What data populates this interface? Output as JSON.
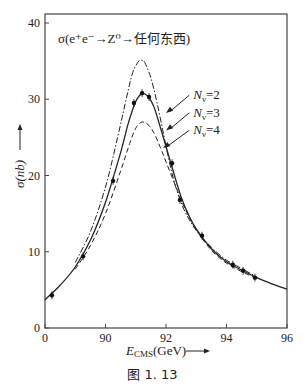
{
  "chart_data": {
    "type": "line",
    "title": "σ(e⁺e⁻→Z⁰→任何东西)",
    "xlabel": "E_CMS(GeV)",
    "ylabel": "σ(nb)",
    "xlim": [
      88,
      96
    ],
    "ylim": [
      0,
      40
    ],
    "x_ticks": [
      88,
      90,
      92,
      94,
      96
    ],
    "x_tick_labels": [
      "0",
      "90",
      "92",
      "94",
      "96"
    ],
    "y_ticks": [
      0,
      10,
      20,
      30,
      40
    ],
    "y_tick_labels": [
      "0",
      "10",
      "20",
      "30",
      "40"
    ],
    "grid": false,
    "caption": "图 1. 13",
    "series": [
      {
        "name": "Nν=2",
        "style": "dashdot",
        "x": [
          89.0,
          89.5,
          90.0,
          90.4,
          90.7,
          90.9,
          91.1,
          91.2,
          91.3,
          91.5,
          91.7,
          91.9,
          92.1,
          92.3,
          92.6,
          93.0,
          93.5,
          94.0,
          94.5,
          95.0
        ],
        "values": [
          8.6,
          12.6,
          18.5,
          25.0,
          30.3,
          33.5,
          35.0,
          35.1,
          34.8,
          32.8,
          29.6,
          25.8,
          22.0,
          18.8,
          15.5,
          12.8,
          10.6,
          8.9,
          7.8,
          6.7
        ]
      },
      {
        "name": "Nν=3",
        "style": "solid",
        "x": [
          88.0,
          88.5,
          89.0,
          89.5,
          90.0,
          90.5,
          90.75,
          91.0,
          91.2,
          91.4,
          91.6,
          91.8,
          92.0,
          92.25,
          92.5,
          92.75,
          93.0,
          93.5,
          94.0,
          94.5,
          95.0,
          95.5,
          96.0
        ],
        "values": [
          3.7,
          5.6,
          8.0,
          11.5,
          16.5,
          23.0,
          26.8,
          29.7,
          30.7,
          30.4,
          29.0,
          26.5,
          23.8,
          20.4,
          17.2,
          14.8,
          13.0,
          10.4,
          8.7,
          7.6,
          6.6,
          5.8,
          5.1
        ]
      },
      {
        "name": "Nν=4",
        "style": "dashed",
        "x": [
          89.0,
          89.5,
          90.0,
          90.5,
          90.8,
          91.0,
          91.2,
          91.4,
          91.6,
          91.8,
          92.0,
          92.3,
          92.6,
          93.0,
          93.5,
          94.0,
          94.5,
          95.0
        ],
        "values": [
          7.7,
          10.8,
          15.0,
          20.6,
          24.2,
          26.2,
          27.0,
          26.7,
          25.6,
          23.8,
          21.8,
          18.8,
          15.9,
          12.9,
          10.2,
          8.5,
          7.4,
          6.5
        ]
      },
      {
        "name": "measured",
        "style": "points",
        "x": [
          88.23,
          89.26,
          90.25,
          90.94,
          91.21,
          91.44,
          92.2,
          92.46,
          93.19,
          94.21,
          94.55,
          94.94
        ],
        "values": [
          4.3,
          9.4,
          19.3,
          29.5,
          30.8,
          30.3,
          21.6,
          16.8,
          12.1,
          8.3,
          7.5,
          6.6
        ]
      }
    ],
    "annotations": [
      {
        "text": "Nν=2",
        "label_x": 92.9,
        "label_y": 30.0,
        "arrow_to_x": 92.0,
        "arrow_to_y": 28.2
      },
      {
        "text": "Nν=3",
        "label_x": 92.9,
        "label_y": 27.7,
        "arrow_to_x": 92.0,
        "arrow_to_y": 25.9
      },
      {
        "text": "Nν=4",
        "label_x": 92.9,
        "label_y": 25.4,
        "arrow_to_x": 91.9,
        "arrow_to_y": 23.6
      }
    ]
  }
}
